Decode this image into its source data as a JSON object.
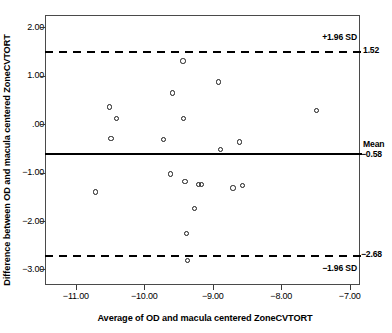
{
  "chart_data": {
    "type": "scatter",
    "title": "",
    "subtitle": "",
    "xlabel": "Average of OD and macula centered ZoneCVTORT",
    "ylabel": "Difference between OD and macula centered ZoneCVTORT",
    "xlim": [
      -11.45,
      -6.85
    ],
    "ylim": [
      -3.32,
      2.25
    ],
    "xticks": [
      -11.0,
      -10.0,
      -9.0,
      -8.0,
      -7.0
    ],
    "xticklabels": [
      "−11.00",
      "−10.00",
      "−9.00",
      "−8.00",
      "−7.00"
    ],
    "yticks": [
      2.0,
      1.0,
      0.0,
      -1.0,
      -2.0,
      -3.0
    ],
    "yticklabels": [
      "2.00",
      "1.00",
      ".00",
      "−1.00",
      "−2.00",
      "−3.00"
    ],
    "grid": false,
    "legend": "none",
    "marker": "open-circle",
    "marker_color": "#1a1a1a",
    "x": [
      -10.73,
      -10.52,
      -10.5,
      -10.42,
      -9.73,
      -9.63,
      -9.6,
      -9.45,
      -9.44,
      -9.42,
      -9.4,
      -9.38,
      -9.28,
      -9.22,
      -9.18,
      -8.93,
      -8.9,
      -8.72,
      -8.62,
      -8.58,
      -7.5
    ],
    "y": [
      -1.38,
      0.37,
      -0.28,
      0.14,
      -0.3,
      -1.01,
      0.66,
      1.32,
      0.14,
      -1.16,
      -2.24,
      -2.79,
      -1.72,
      -1.22,
      -1.22,
      0.89,
      -0.5,
      -1.3,
      -0.35,
      -1.25,
      0.3
    ],
    "points": [
      {
        "x": -10.73,
        "y": -1.38
      },
      {
        "x": -10.52,
        "y": 0.37
      },
      {
        "x": -10.5,
        "y": -0.28
      },
      {
        "x": -10.42,
        "y": 0.14
      },
      {
        "x": -9.73,
        "y": -0.3
      },
      {
        "x": -9.63,
        "y": -1.01
      },
      {
        "x": -9.6,
        "y": 0.66
      },
      {
        "x": -9.45,
        "y": 1.32
      },
      {
        "x": -9.44,
        "y": 0.14
      },
      {
        "x": -9.42,
        "y": -1.16
      },
      {
        "x": -9.4,
        "y": -2.24
      },
      {
        "x": -9.38,
        "y": -2.79
      },
      {
        "x": -9.28,
        "y": -1.72
      },
      {
        "x": -9.22,
        "y": -1.22
      },
      {
        "x": -9.18,
        "y": -1.22
      },
      {
        "x": -8.93,
        "y": 0.89
      },
      {
        "x": -8.9,
        "y": -0.5
      },
      {
        "x": -8.72,
        "y": -1.3
      },
      {
        "x": -8.62,
        "y": -0.35
      },
      {
        "x": -8.58,
        "y": -1.25
      },
      {
        "x": -7.5,
        "y": 0.3
      }
    ],
    "reference_lines": [
      {
        "name": "upper_loa",
        "value": 1.52,
        "style": "dashed",
        "label_top": "+1.96 SD",
        "label_value": "1.52"
      },
      {
        "name": "mean",
        "value": -0.58,
        "style": "solid",
        "label_top": "Mean",
        "label_value": "−0.58"
      },
      {
        "name": "lower_loa",
        "value": -2.68,
        "style": "dashed",
        "label_top": "−2.68",
        "label_value": "−1.96 SD"
      }
    ]
  },
  "annotations": {
    "upper_sd_label": "+1.96 SD",
    "upper_sd_value": "1.52",
    "mean_label": "Mean",
    "mean_value": "−0.58",
    "lower_sd_value": "−2.68",
    "lower_sd_label": "−1.96 SD"
  },
  "axes": {
    "x_title": "Average of OD and macula centered ZoneCVTORT",
    "y_title": "Difference between OD and macula centered ZoneCVTORT",
    "x_tick_labels": [
      "−11.00",
      "−10.00",
      "−9.00",
      "−8.00",
      "−7.00"
    ],
    "y_tick_labels": [
      "2.00",
      "1.00",
      ".00",
      "−1.00",
      "−2.00",
      "−3.00"
    ]
  }
}
